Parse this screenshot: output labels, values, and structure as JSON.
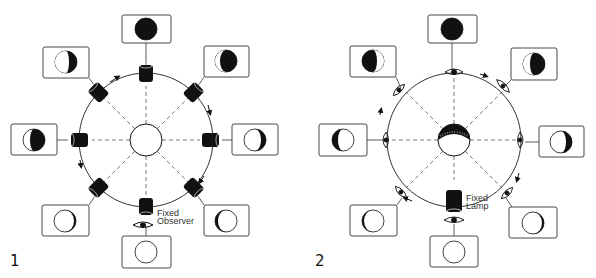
{
  "figures": [
    {
      "number": "1",
      "title": "Fixed observer, moving light source",
      "label_text": [
        "Fixed",
        "Observer"
      ],
      "center": {
        "x": 146,
        "y": 140
      },
      "orbit_radius": 67,
      "body": "unlit sphere",
      "orbit_elements": "lamp (black cylinder) at each of 8 positions",
      "direction": "clockwise",
      "phases": [
        {
          "pos": "top",
          "phase": "new (mostly dark)",
          "box": [
            122,
            15,
            49,
            28
          ]
        },
        {
          "pos": "top-right",
          "phase": "waxing crescent lit left edge",
          "box": [
            204,
            46,
            45,
            31
          ]
        },
        {
          "pos": "right",
          "phase": "crescent dark right",
          "box": [
            232,
            124,
            46,
            31
          ]
        },
        {
          "pos": "bottom-right",
          "phase": "thin dark left edge",
          "box": [
            204,
            205,
            45,
            31
          ]
        },
        {
          "pos": "bottom",
          "phase": "full",
          "box": [
            122,
            236,
            49,
            32
          ]
        },
        {
          "pos": "bottom-left",
          "phase": "thin dark right edge",
          "box": [
            42,
            205,
            47,
            31
          ]
        },
        {
          "pos": "left",
          "phase": "gibbous dark right",
          "box": [
            11,
            124,
            46,
            31
          ]
        },
        {
          "pos": "top-left",
          "phase": "mostly dark, lit left",
          "box": [
            43,
            47,
            46,
            31
          ]
        }
      ]
    },
    {
      "number": "2",
      "title": "Fixed lamp, moving observer",
      "label_text": [
        "Fixed",
        "Lamp"
      ],
      "center": {
        "x": 454,
        "y": 140
      },
      "orbit_radius": 67,
      "body": "partially lit sphere",
      "orbit_elements": "eye (observer) at each of 8 positions",
      "direction": "clockwise",
      "phases": [
        {
          "pos": "top",
          "phase": "new (mostly dark)",
          "box": [
            428,
            15,
            49,
            28
          ]
        },
        {
          "pos": "top-right",
          "phase": "dark, lit left edge",
          "box": [
            511,
            48,
            46,
            32
          ]
        },
        {
          "pos": "right",
          "phase": "crescent dark right",
          "box": [
            539,
            126,
            45,
            31
          ]
        },
        {
          "pos": "bottom-right",
          "phase": "thin dark right edge",
          "box": [
            509,
            207,
            48,
            31
          ]
        },
        {
          "pos": "bottom",
          "phase": "full",
          "box": [
            430,
            236,
            48,
            31
          ]
        },
        {
          "pos": "bottom-left",
          "phase": "thin dark left edge",
          "box": [
            350,
            205,
            47,
            31
          ]
        },
        {
          "pos": "left",
          "phase": "crescent dark left",
          "box": [
            319,
            124,
            48,
            32
          ]
        },
        {
          "pos": "top-left",
          "phase": "mostly dark, lit right",
          "box": [
            350,
            46,
            46,
            31
          ]
        }
      ]
    }
  ],
  "colors": {
    "ink": "#111111",
    "paper": "#ffffff",
    "line": "#555555"
  }
}
